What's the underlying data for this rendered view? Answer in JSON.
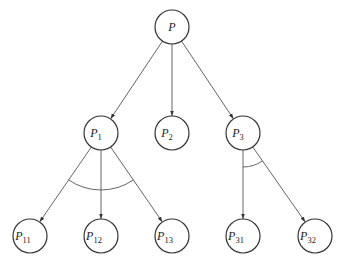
{
  "diagram": {
    "title": "",
    "type": "and-or tree",
    "nodes": [
      {
        "id": "P",
        "main": "P",
        "sub": "",
        "cx": 172,
        "cy": 27
      },
      {
        "id": "P1",
        "main": "P",
        "sub": "1",
        "cx": 101,
        "cy": 133
      },
      {
        "id": "P2",
        "main": "P",
        "sub": "2",
        "cx": 172,
        "cy": 133
      },
      {
        "id": "P3",
        "main": "P",
        "sub": "3",
        "cx": 243,
        "cy": 133
      },
      {
        "id": "P11",
        "main": "P",
        "sub": "11",
        "cx": 30,
        "cy": 236
      },
      {
        "id": "P12",
        "main": "P",
        "sub": "12",
        "cx": 101,
        "cy": 236
      },
      {
        "id": "P13",
        "main": "P",
        "sub": "13",
        "cx": 172,
        "cy": 236
      },
      {
        "id": "P31",
        "main": "P",
        "sub": "31",
        "cx": 243,
        "cy": 236
      },
      {
        "id": "P32",
        "main": "P",
        "sub": "32",
        "cx": 315,
        "cy": 236
      }
    ],
    "edges": [
      {
        "from": "P",
        "to": "P1"
      },
      {
        "from": "P",
        "to": "P2"
      },
      {
        "from": "P",
        "to": "P3"
      },
      {
        "from": "P1",
        "to": "P11"
      },
      {
        "from": "P1",
        "to": "P12"
      },
      {
        "from": "P1",
        "to": "P13"
      },
      {
        "from": "P3",
        "to": "P31"
      },
      {
        "from": "P3",
        "to": "P32"
      }
    ],
    "and_arcs": [
      {
        "node": "P1",
        "children": [
          "P11",
          "P12",
          "P13"
        ],
        "radius": 40
      },
      {
        "node": "P3",
        "children": [
          "P31",
          "P32"
        ],
        "radius": 17
      }
    ],
    "node_radius": 17,
    "colors": {
      "stroke": "#333333",
      "edge": "#555555",
      "text": "#222222",
      "background": "#ffffff"
    }
  }
}
